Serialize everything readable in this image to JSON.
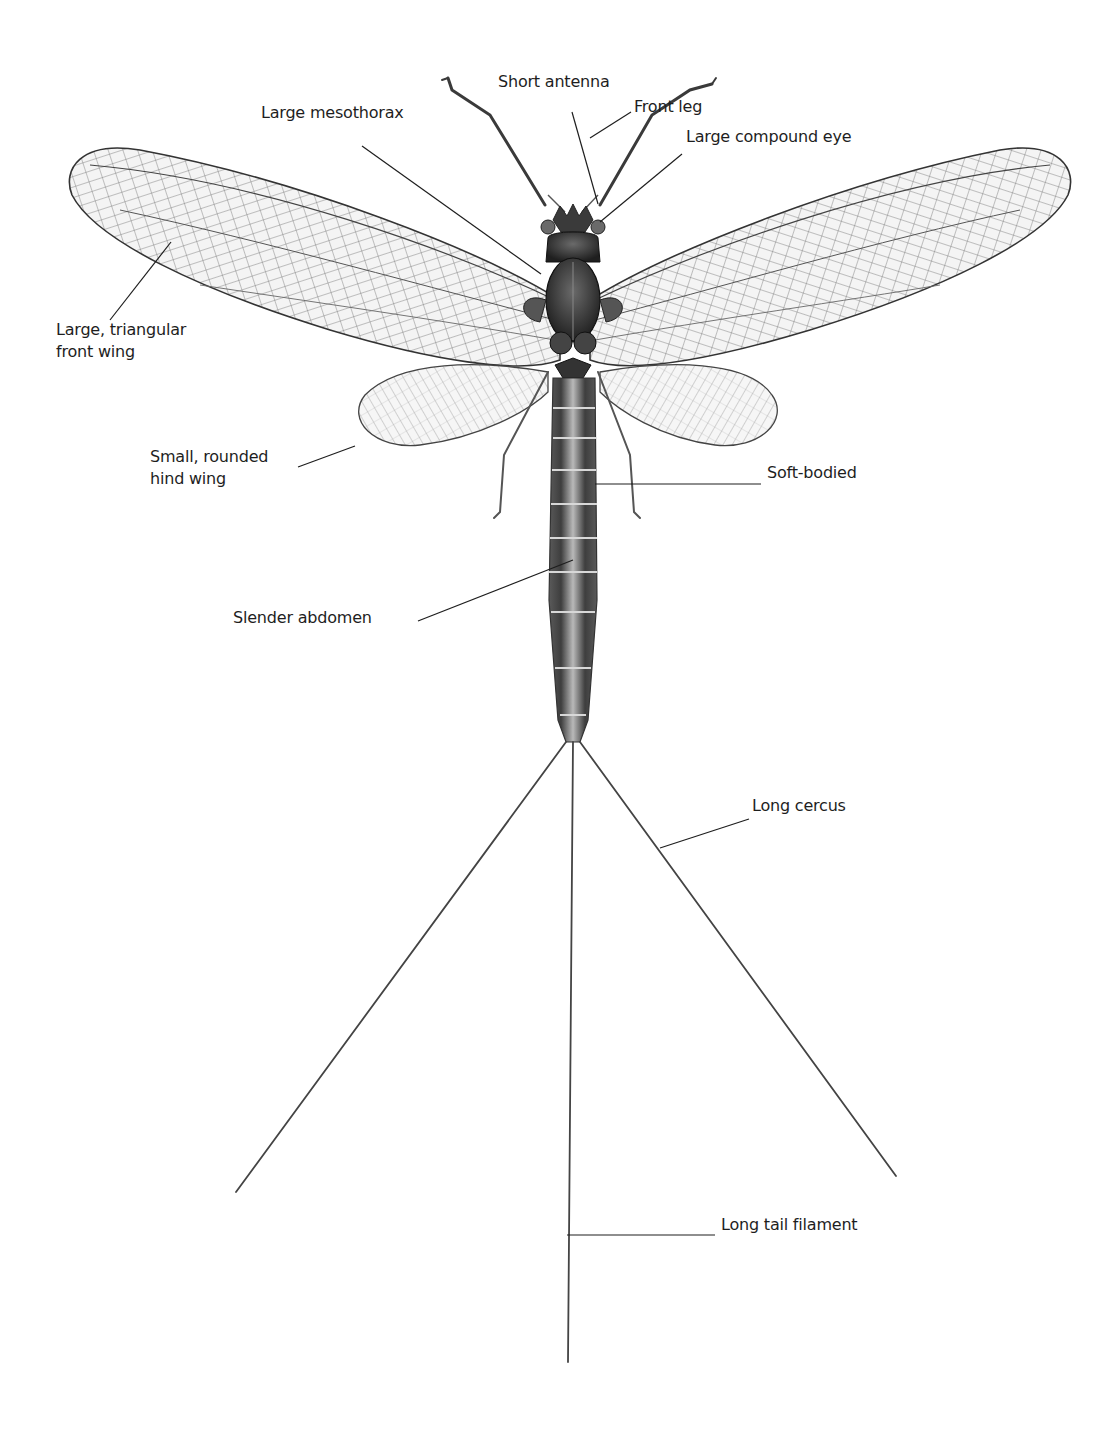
{
  "diagram": {
    "background": "#ffffff",
    "ink_color": "#1e1e1e",
    "labels": [
      {
        "id": "short-antenna",
        "text": "Short antenna",
        "x": 498,
        "y": 82,
        "line": [
          [
            572,
            112
          ],
          [
            598,
            204
          ]
        ]
      },
      {
        "id": "front-leg",
        "text": "Front leg",
        "x": 634,
        "y": 107,
        "line": [
          [
            631,
            112
          ],
          [
            590,
            138
          ]
        ]
      },
      {
        "id": "large-mesothorax",
        "text": "Large mesothorax",
        "x": 261,
        "y": 113,
        "line": [
          [
            362,
            146
          ],
          [
            541,
            274
          ]
        ]
      },
      {
        "id": "large-compound-eye",
        "text": "Large compound eye",
        "x": 686,
        "y": 137,
        "line": [
          [
            682,
            154
          ],
          [
            600,
            222
          ]
        ]
      },
      {
        "id": "large-triangular-front-wing",
        "text": "Large, triangular\nfront wing",
        "x": 56,
        "y": 330,
        "line": [
          [
            110,
            320
          ],
          [
            171,
            242
          ]
        ]
      },
      {
        "id": "small-rounded-hind-wing",
        "text": "Small, rounded\nhind wing",
        "x": 150,
        "y": 457,
        "line": [
          [
            298,
            467
          ],
          [
            355,
            446
          ]
        ]
      },
      {
        "id": "soft-bodied",
        "text": "Soft-bodied",
        "x": 767,
        "y": 473,
        "line": [
          [
            595,
            484
          ],
          [
            761,
            484
          ]
        ]
      },
      {
        "id": "slender-abdomen",
        "text": "Slender abdomen",
        "x": 233,
        "y": 618,
        "line": [
          [
            418,
            621
          ],
          [
            573,
            560
          ]
        ]
      },
      {
        "id": "long-cercus",
        "text": "Long cercus",
        "x": 752,
        "y": 806,
        "line": [
          [
            660,
            848
          ],
          [
            749,
            819
          ]
        ]
      },
      {
        "id": "long-tail-filament",
        "text": "Long tail filament",
        "x": 721,
        "y": 1225,
        "line": [
          [
            567,
            1235
          ],
          [
            715,
            1235
          ]
        ]
      }
    ]
  }
}
